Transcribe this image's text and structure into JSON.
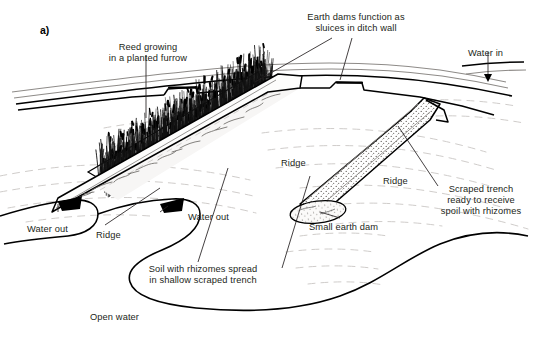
{
  "figure": {
    "panel_label": "a)",
    "domain_type": "diagram",
    "style": "pen-and-ink perspective line drawing"
  },
  "labels": {
    "reed_furrow": "Reed growing\nin a planted furrow",
    "earth_dams": "Earth dams function as\nsluices in ditch wall",
    "water_in": "Water in",
    "water_out_left": "Water out",
    "water_out_mid": "Water out",
    "ridge_center": "Ridge",
    "ridge_left": "Ridge",
    "ridge_right": "Ridge",
    "scraped_trench": "Scraped trench\nready to receive\nspoil with rhizomes",
    "small_earth_dam": "Small earth dam",
    "soil_rhizomes": "Soil with rhizomes spread\nin shallow scraped trench",
    "open_water": "Open water"
  },
  "colors": {
    "ink": "#231f20",
    "line": "#000000",
    "contour": "#c9c6c4",
    "fill_light": "#f2f1ef",
    "stipple": "#6e6b68",
    "background": "#ffffff"
  },
  "elements": {
    "reed_bed": "dense band of vertical reed strokes along planted furrow",
    "ditch_channel": "long thin channel running upper-left to right with water inlet",
    "dam_notches": "two stepped notches in ditch wall acting as sluices",
    "trench_spoil": "hatched trench containing spread soil with rhizomes",
    "trench_empty": "stippled scraped trench awaiting spoil",
    "earth_dam_ellipse": "stippled ellipse blocking end of scraped trench",
    "shoreline": "curved open-water shoreline at lower portion",
    "contours": "light dashed ground contour lines"
  }
}
